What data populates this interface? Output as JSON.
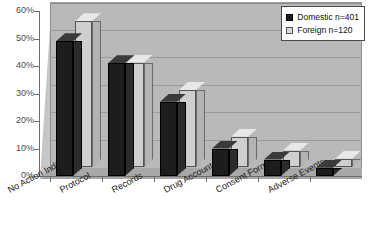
{
  "chart_data": {
    "type": "bar",
    "title": "",
    "xlabel": "",
    "ylabel": "",
    "ylim": [
      0,
      60
    ],
    "ytick_labels": [
      "0%",
      "10%",
      "20%",
      "30%",
      "40%",
      "50%",
      "60%"
    ],
    "ytick_values": [
      0,
      10,
      20,
      30,
      40,
      50,
      60
    ],
    "grid": true,
    "legend_position": "top-right",
    "categories": [
      "No Action Indicated",
      "Protocol",
      "Records",
      "Drug Accountability",
      "Consent Form",
      "Adverse Events"
    ],
    "series": [
      {
        "name": "Domestic n=401",
        "color": "#1d1d1d",
        "values": [
          49,
          41,
          27,
          10,
          6,
          3
        ]
      },
      {
        "name": "Foreign n=120",
        "color": "#cfcfcf",
        "values": [
          53,
          38,
          28,
          11,
          6,
          3
        ]
      }
    ]
  },
  "legend": {
    "items": [
      {
        "label": "Domestic n=401",
        "swatch": "black-square-swatch"
      },
      {
        "label": "Foreign n=120",
        "swatch": "gray-square-swatch"
      }
    ]
  }
}
